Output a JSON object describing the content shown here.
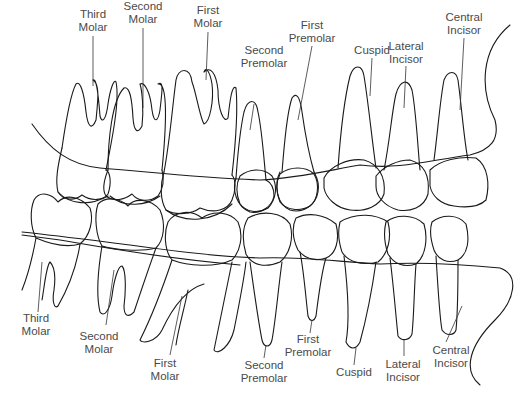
{
  "colors": {
    "line": "#1a1a1a",
    "label": "#4a4a4a",
    "background": "#ffffff"
  },
  "upper_labels": [
    {
      "line1": "Third",
      "line2": "Molar",
      "x": 93,
      "y": 8
    },
    {
      "line1": "Second",
      "line2": "Molar",
      "x": 143,
      "y": 0
    },
    {
      "line1": "First",
      "line2": "Molar",
      "x": 208,
      "y": 4
    },
    {
      "line1": "Second",
      "line2": "Premolar",
      "x": 264,
      "y": 44
    },
    {
      "line1": "First",
      "line2": "Premolar",
      "x": 312,
      "y": 19
    },
    {
      "line1": "Cuspid",
      "line2": "",
      "x": 372,
      "y": 44
    },
    {
      "line1": "Lateral",
      "line2": "Incisor",
      "x": 406,
      "y": 40
    },
    {
      "line1": "Central",
      "line2": "Incisor",
      "x": 464,
      "y": 11
    }
  ],
  "lower_labels": [
    {
      "line1": "Third",
      "line2": "Molar",
      "x": 36,
      "y": 312
    },
    {
      "line1": "Second",
      "line2": "Molar",
      "x": 99,
      "y": 330
    },
    {
      "line1": "First",
      "line2": "Molar",
      "x": 165,
      "y": 357
    },
    {
      "line1": "Second",
      "line2": "Premolar",
      "x": 264,
      "y": 359
    },
    {
      "line1": "First",
      "line2": "Premolar",
      "x": 308,
      "y": 333
    },
    {
      "line1": "Cuspid",
      "line2": "",
      "x": 354,
      "y": 366
    },
    {
      "line1": "Lateral",
      "line2": "Incisor",
      "x": 403,
      "y": 358
    },
    {
      "line1": "Central",
      "line2": "Incisor",
      "x": 451,
      "y": 344
    }
  ]
}
